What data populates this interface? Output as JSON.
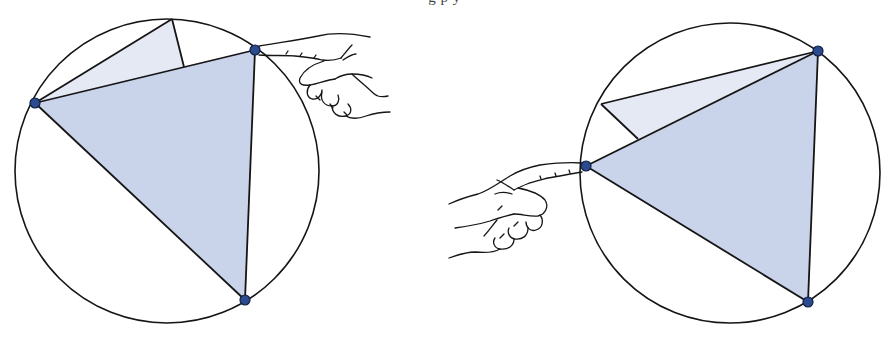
{
  "caption": {
    "text": "g p y"
  },
  "colors": {
    "stroke": "#151515",
    "main_triangle_fill": "#c9d3ea",
    "light_triangle_fill": "#e5e9f4",
    "vertex_dot_fill": "#2b4b8e",
    "vertex_dot_stroke": "#0e1f44",
    "background": "#ffffff"
  },
  "figures": [
    {
      "name": "left-figure",
      "circle": {
        "cx": 167,
        "cy": 171,
        "r": 152
      },
      "vertices": {
        "A": [
          35,
          103
        ],
        "B": [
          255,
          50
        ],
        "C": [
          245,
          300
        ]
      },
      "light_triangle": {
        "apex": [
          172,
          19
        ],
        "foot": [
          184,
          67
        ]
      },
      "hand": {
        "pointing": "left",
        "touching_vertex": "B"
      }
    },
    {
      "name": "right-figure",
      "circle": {
        "cx": 730,
        "cy": 173,
        "r": 150
      },
      "vertices": {
        "A": [
          586,
          166
        ],
        "B": [
          818,
          51
        ],
        "C": [
          808,
          302
        ]
      },
      "light_triangle": {
        "apex": [
          601,
          104
        ],
        "foot": [
          638,
          139
        ]
      },
      "hand": {
        "pointing": "right",
        "touching_vertex": "A"
      }
    }
  ]
}
